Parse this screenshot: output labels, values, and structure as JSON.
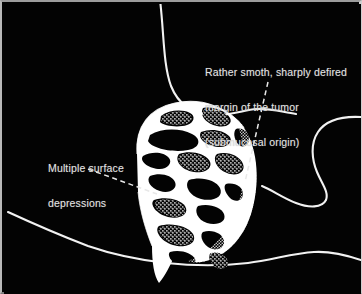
{
  "figure": {
    "kind": "medical-illustration",
    "background_color": "#030303",
    "ink_color": "#ffffff",
    "text_color": "#e2e2e2",
    "border_color": "#b9b9b9"
  },
  "annotations": {
    "margin": {
      "name": "margin-annotation",
      "lines": [
        "Rather smoth, sharply defired",
        "margin of the tumor",
        "(submucosal origin)"
      ],
      "line1": "Rather smoth, sharply defired",
      "line2": "margin of the tumor",
      "line3": "(submucosal origin)",
      "leader": "dashed",
      "points_to": "right margin of the tumor mass"
    },
    "depressions": {
      "name": "depressions-annotation",
      "lines": [
        "Multiple surface",
        "depressions"
      ],
      "line1": "Multiple surface",
      "line2": "depressions",
      "leader": "dashed",
      "points_to": "surface of the tumor mass"
    }
  },
  "anatomy": {
    "items": [
      {
        "name": "upper-wall-contour",
        "label": "upper gastric wall contour"
      },
      {
        "name": "lower-wall-contour",
        "label": "lower gastric wall contour"
      },
      {
        "name": "pyloric-hook-contour",
        "label": "pyloric / duodenal hook contour"
      },
      {
        "name": "tumor-mass",
        "label": "tumor mass with barium-coated surface"
      },
      {
        "name": "stippled-margin",
        "label": "stippled tumor margin"
      }
    ]
  }
}
